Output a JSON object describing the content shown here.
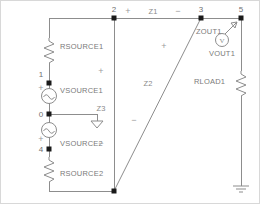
{
  "diagram": {
    "background_color": "#ffffff",
    "wire_color": "#8d8d8d",
    "label_color": "#7a7a7a",
    "node_color": "#1a1a1a"
  },
  "nodes": [
    {
      "id": "n1",
      "label": "1",
      "x": 48,
      "y": 73
    },
    {
      "id": "n2",
      "label": "2",
      "x": 77,
      "y": 17
    },
    {
      "id": "n3",
      "label": "3",
      "x": 200,
      "y": 17
    },
    {
      "id": "n5",
      "label": "5",
      "x": 240,
      "y": 17
    },
    {
      "id": "n0",
      "label": "0",
      "x": 48,
      "y": 113
    },
    {
      "id": "n4",
      "label": "4",
      "x": 48,
      "y": 148
    }
  ],
  "components": [
    {
      "id": "rsource1",
      "label": "RSOURCE1",
      "type": "resistor"
    },
    {
      "id": "vsource1",
      "label": "VSOURCE1",
      "type": "ac-source"
    },
    {
      "id": "vsource2",
      "label": "VSOURCE2",
      "type": "ac-source"
    },
    {
      "id": "rsource2",
      "label": "RSOURCE2",
      "type": "resistor"
    },
    {
      "id": "zout1",
      "label": "ZOUT1",
      "type": "impedance-probe"
    },
    {
      "id": "vout1",
      "label": "VOUT1",
      "type": "voltmeter"
    },
    {
      "id": "rload1",
      "label": "RLOAD1",
      "type": "resistor"
    }
  ],
  "impedances": [
    {
      "id": "z1",
      "label": "Z1",
      "plus": "+",
      "minus": "−",
      "orientation": "horizontal"
    },
    {
      "id": "z2",
      "label": "Z2",
      "plus": "+",
      "minus": "−",
      "orientation": "diagonal"
    },
    {
      "id": "z3",
      "label": "Z3",
      "plus": "+",
      "minus": "−",
      "orientation": "vertical"
    }
  ],
  "polarity": {
    "vsource1_plus": "+",
    "vsource1_minus": "−",
    "vsource2_plus": "+",
    "vsource2_minus": "−"
  },
  "grounds": [
    {
      "id": "gnd-center",
      "style": "triangle"
    },
    {
      "id": "gnd-right",
      "style": "bar"
    }
  ],
  "meter_glyphs": {
    "voltmeter": "V",
    "source": "∿"
  }
}
